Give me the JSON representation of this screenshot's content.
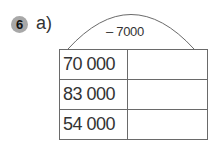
{
  "exercise": {
    "number": "6",
    "part": "a)",
    "operation": "– 7000",
    "rows": [
      {
        "input": "70 000",
        "output": ""
      },
      {
        "input": "83 000",
        "output": ""
      },
      {
        "input": "54 000",
        "output": ""
      }
    ]
  },
  "colors": {
    "badge": "#a8a8a8",
    "lines": "#6a6a6a",
    "text": "#333333"
  }
}
